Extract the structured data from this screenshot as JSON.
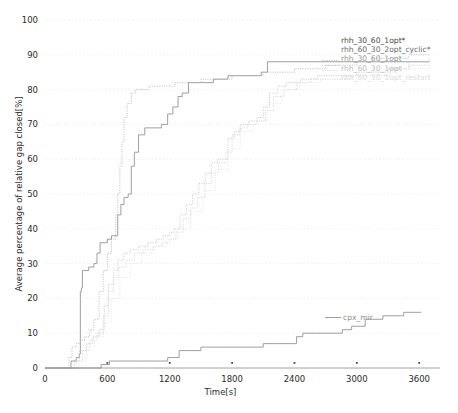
{
  "chart_data": {
    "type": "line",
    "title": "",
    "xlabel": "Time[s]",
    "ylabel": "Average percentage of relative gap closed[%]",
    "xlim": [
      0,
      3800
    ],
    "ylim": [
      0,
      100
    ],
    "xticks": [
      0,
      600,
      1200,
      1800,
      2400,
      3000,
      3600
    ],
    "xtick_labels": [
      "0",
      "600",
      "1200",
      "1800",
      "2400",
      "3000",
      "3600"
    ],
    "yticks": [
      0,
      10,
      20,
      30,
      40,
      50,
      60,
      70,
      80,
      90,
      100
    ],
    "ytick_labels": [
      "0",
      "10",
      "20",
      "30",
      "40",
      "50",
      "60",
      "70",
      "80",
      "90",
      "100"
    ],
    "grid": true,
    "grid_axis": "y",
    "legend_position": "right-inline-labels",
    "series": [
      {
        "name": "rhh_30_60_1opt*",
        "label_color": "#4d4d4d",
        "line_color": "#9a9a9a",
        "style": "solid",
        "points": [
          [
            0,
            0
          ],
          [
            230,
            0
          ],
          [
            250,
            2
          ],
          [
            300,
            3
          ],
          [
            330,
            4
          ],
          [
            340,
            22
          ],
          [
            350,
            23
          ],
          [
            360,
            28
          ],
          [
            420,
            29
          ],
          [
            470,
            30
          ],
          [
            500,
            33
          ],
          [
            530,
            36
          ],
          [
            600,
            37
          ],
          [
            640,
            38
          ],
          [
            700,
            44
          ],
          [
            730,
            47
          ],
          [
            760,
            49
          ],
          [
            800,
            50
          ],
          [
            830,
            58
          ],
          [
            860,
            62
          ],
          [
            900,
            67
          ],
          [
            960,
            69
          ],
          [
            1120,
            70
          ],
          [
            1180,
            73
          ],
          [
            1230,
            75
          ],
          [
            1280,
            78
          ],
          [
            1320,
            79
          ],
          [
            1380,
            82
          ],
          [
            1560,
            82
          ],
          [
            1620,
            83
          ],
          [
            1760,
            84
          ],
          [
            1840,
            84
          ],
          [
            2080,
            85
          ],
          [
            2140,
            88
          ],
          [
            2460,
            88
          ],
          [
            2800,
            88
          ],
          [
            3200,
            88
          ],
          [
            3600,
            88
          ],
          [
            3700,
            88
          ]
        ]
      },
      {
        "name": "rhh_60_30_2opt_cyclic*",
        "label_color": "#6d6d6d",
        "line_color": "#b9b9b9",
        "style": "dotted",
        "points": [
          [
            0,
            0
          ],
          [
            200,
            0
          ],
          [
            230,
            3
          ],
          [
            260,
            6
          ],
          [
            300,
            7
          ],
          [
            340,
            8
          ],
          [
            380,
            9
          ],
          [
            430,
            11
          ],
          [
            470,
            14
          ],
          [
            520,
            22
          ],
          [
            560,
            28
          ],
          [
            600,
            33
          ],
          [
            640,
            37
          ],
          [
            680,
            44
          ],
          [
            700,
            50
          ],
          [
            720,
            58
          ],
          [
            740,
            65
          ],
          [
            760,
            72
          ],
          [
            790,
            76
          ],
          [
            830,
            79
          ],
          [
            870,
            80
          ],
          [
            940,
            80
          ],
          [
            1000,
            81
          ],
          [
            1100,
            81
          ],
          [
            1250,
            82
          ],
          [
            1500,
            83
          ],
          [
            1800,
            84
          ],
          [
            2100,
            85
          ],
          [
            2400,
            86
          ],
          [
            2700,
            87
          ],
          [
            3000,
            88
          ],
          [
            3150,
            89
          ],
          [
            3300,
            89
          ],
          [
            3500,
            90
          ],
          [
            3700,
            90
          ]
        ]
      },
      {
        "name": "rhh_30_60_1opt",
        "label_color": "#8f8f8f",
        "line_color": "#c6c6c6",
        "style": "dotted",
        "points": [
          [
            0,
            0
          ],
          [
            240,
            0
          ],
          [
            280,
            2
          ],
          [
            330,
            5
          ],
          [
            400,
            7
          ],
          [
            460,
            9
          ],
          [
            520,
            11
          ],
          [
            570,
            18
          ],
          [
            610,
            24
          ],
          [
            660,
            28
          ],
          [
            700,
            31
          ],
          [
            760,
            33
          ],
          [
            820,
            34
          ],
          [
            900,
            35
          ],
          [
            990,
            36
          ],
          [
            1070,
            37
          ],
          [
            1140,
            38
          ],
          [
            1200,
            39
          ],
          [
            1240,
            40
          ],
          [
            1300,
            44
          ],
          [
            1360,
            47
          ],
          [
            1420,
            50
          ],
          [
            1480,
            53
          ],
          [
            1540,
            56
          ],
          [
            1600,
            59
          ],
          [
            1660,
            60
          ],
          [
            1720,
            60
          ],
          [
            1760,
            66
          ],
          [
            1820,
            68
          ],
          [
            1880,
            70
          ],
          [
            1960,
            71
          ],
          [
            2040,
            72
          ],
          [
            2100,
            75
          ],
          [
            2160,
            79
          ],
          [
            2240,
            81
          ],
          [
            2320,
            82
          ],
          [
            2460,
            83
          ],
          [
            2620,
            84
          ],
          [
            2800,
            84
          ],
          [
            3000,
            85
          ],
          [
            3150,
            85
          ],
          [
            3300,
            86
          ],
          [
            3500,
            88
          ],
          [
            3700,
            89
          ]
        ]
      },
      {
        "name": "rhh_60_30_1opt",
        "label_color": "#b0b0b0",
        "line_color": "#d2d2d2",
        "style": "dotted",
        "points": [
          [
            0,
            0
          ],
          [
            250,
            0
          ],
          [
            300,
            2
          ],
          [
            360,
            5
          ],
          [
            430,
            8
          ],
          [
            500,
            10
          ],
          [
            560,
            15
          ],
          [
            610,
            22
          ],
          [
            660,
            26
          ],
          [
            710,
            29
          ],
          [
            780,
            31
          ],
          [
            860,
            33
          ],
          [
            950,
            34
          ],
          [
            1040,
            35
          ],
          [
            1130,
            36
          ],
          [
            1200,
            37
          ],
          [
            1260,
            39
          ],
          [
            1330,
            43
          ],
          [
            1400,
            46
          ],
          [
            1470,
            49
          ],
          [
            1540,
            53
          ],
          [
            1600,
            56
          ],
          [
            1670,
            59
          ],
          [
            1740,
            62
          ],
          [
            1800,
            67
          ],
          [
            1870,
            69
          ],
          [
            1950,
            70
          ],
          [
            2040,
            71
          ],
          [
            2120,
            74
          ],
          [
            2200,
            78
          ],
          [
            2300,
            80
          ],
          [
            2420,
            82
          ],
          [
            2560,
            83
          ],
          [
            2740,
            83
          ],
          [
            2950,
            84
          ],
          [
            3150,
            84
          ],
          [
            3320,
            86
          ],
          [
            3500,
            87
          ],
          [
            3700,
            87
          ]
        ]
      },
      {
        "name": "rhh_60_30_1opt_restart",
        "label_color": "#dedede",
        "line_color": "#e6e6e6",
        "style": "dotted",
        "points": [
          [
            0,
            0
          ],
          [
            260,
            0
          ],
          [
            320,
            2
          ],
          [
            400,
            6
          ],
          [
            480,
            9
          ],
          [
            560,
            13
          ],
          [
            640,
            20
          ],
          [
            720,
            26
          ],
          [
            820,
            30
          ],
          [
            930,
            33
          ],
          [
            1050,
            35
          ],
          [
            1170,
            37
          ],
          [
            1280,
            40
          ],
          [
            1400,
            45
          ],
          [
            1520,
            51
          ],
          [
            1640,
            57
          ],
          [
            1760,
            63
          ],
          [
            1880,
            68
          ],
          [
            2000,
            71
          ],
          [
            2140,
            76
          ],
          [
            2280,
            80
          ],
          [
            2450,
            82
          ],
          [
            2650,
            83
          ],
          [
            2900,
            84
          ],
          [
            3150,
            85
          ],
          [
            3400,
            86
          ],
          [
            3700,
            87
          ]
        ]
      },
      {
        "name": "cpx_mir",
        "label_color": "#8f8f8f",
        "line_color": "#9a9a9a",
        "style": "solid",
        "points": [
          [
            0,
            0
          ],
          [
            500,
            0
          ],
          [
            540,
            1
          ],
          [
            620,
            2
          ],
          [
            700,
            2
          ],
          [
            900,
            2
          ],
          [
            1080,
            2
          ],
          [
            1180,
            3
          ],
          [
            1260,
            3
          ],
          [
            1290,
            5
          ],
          [
            1400,
            5
          ],
          [
            1500,
            6
          ],
          [
            1600,
            6
          ],
          [
            1700,
            6
          ],
          [
            1900,
            6
          ],
          [
            2100,
            7
          ],
          [
            2250,
            7
          ],
          [
            2380,
            7
          ],
          [
            2420,
            9
          ],
          [
            2480,
            10
          ],
          [
            2600,
            10
          ],
          [
            2750,
            10
          ],
          [
            2860,
            11
          ],
          [
            2950,
            12
          ],
          [
            3010,
            12
          ],
          [
            3080,
            14
          ],
          [
            3150,
            14
          ],
          [
            3250,
            15
          ],
          [
            3350,
            15
          ],
          [
            3450,
            16
          ],
          [
            3560,
            16
          ],
          [
            3620,
            16
          ]
        ]
      }
    ],
    "inline_labels": [
      {
        "text": "rhh_30_60_1opt*",
        "color": "#4d4d4d"
      },
      {
        "text": "rhh_60_30_2opt_cyclic*",
        "color": "#6d6d6d"
      },
      {
        "text": "rhh_30_60_1opt",
        "color": "#9a9a9a"
      },
      {
        "text": "rhh_60_30_1opt",
        "color": "#bcbcbc"
      },
      {
        "text": "rhh_60_30_1opt_restart",
        "color": "#dcdcdc"
      }
    ],
    "cpx_label": {
      "text": "cpx_mir",
      "color": "#8f8f8f"
    }
  },
  "caption": {
    "text": ""
  }
}
